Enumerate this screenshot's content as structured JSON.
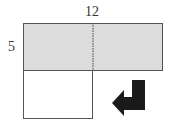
{
  "diagram": {
    "top_label": "12",
    "side_label": "5",
    "colors": {
      "shaded_fill": "#dcdcdc",
      "stroke": "#555555",
      "arrow": "#1a1a1a",
      "background": "#ffffff"
    },
    "shapes": {
      "shaded_rectangle": {
        "description": "12 by 5 shaded rectangle split by dotted line"
      },
      "lower_square": {
        "description": "unshaded square below left half"
      },
      "arrow": {
        "description": "bent arrow pointing down then left"
      }
    }
  }
}
